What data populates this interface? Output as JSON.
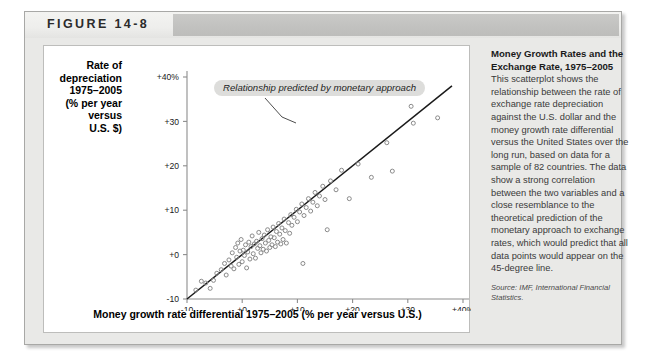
{
  "figure": {
    "title": "FIGURE 14-8"
  },
  "caption": {
    "heading": "Money Growth Rates and the Exchange Rate, 1975–2005",
    "body": " This scatterplot shows the relationship between the rate of exchange rate depreciation against the U.S. dollar and the money growth rate differential versus the United States over the long run, based on data for a sample of 82 countries. The data show a strong correlation between the two variables and a close resemblance to the theoretical prediction of the monetary approach to exchange rates, which would predict that all data points would appear on the 45-degree line.",
    "source": "Source: IMF, International Financial Statistics."
  },
  "annotation": {
    "text": "Relationship predicted by monetary approach"
  },
  "chart_data": {
    "type": "scatter",
    "title": "",
    "xlabel": "Money growth rate differential 1975–2005 (% per year versus U.S.)",
    "ylabel": "Rate of depreciation\n1975–2005\n(% per year\nversus\nU.S. $)",
    "xlim": [
      -10,
      40
    ],
    "ylim": [
      -10,
      40
    ],
    "xticks": [
      -10,
      0,
      10,
      20,
      30,
      40
    ],
    "yticks": [
      -10,
      0,
      10,
      20,
      30,
      40
    ],
    "xticklabels": [
      "-10",
      "+0",
      "+10",
      "+20",
      "+30",
      "+40%"
    ],
    "yticklabels": [
      "-10",
      "+0",
      "+10",
      "+20",
      "+30",
      "+40%"
    ],
    "grid": false,
    "legend": null,
    "reference_line": {
      "label": "45-degree line",
      "from": [
        -10,
        -10
      ],
      "to": [
        38,
        38
      ]
    },
    "marker": {
      "shape": "open-circle",
      "size": 4,
      "color": "#8a8a8a"
    },
    "points": [
      [
        -8.4,
        -8.0
      ],
      [
        -6.6,
        -6.4
      ],
      [
        -5.2,
        -5.8
      ],
      [
        -4.6,
        -4.2
      ],
      [
        -3.8,
        -3.4
      ],
      [
        -3.2,
        -2.0
      ],
      [
        -2.9,
        -4.6
      ],
      [
        -2.4,
        -1.2
      ],
      [
        -2.0,
        -2.6
      ],
      [
        -1.8,
        0.4
      ],
      [
        -1.5,
        -3.2
      ],
      [
        -1.2,
        1.6
      ],
      [
        -1.0,
        -0.6
      ],
      [
        -0.8,
        2.6
      ],
      [
        -0.6,
        -2.2
      ],
      [
        -0.4,
        0.8
      ],
      [
        -0.2,
        3.4
      ],
      [
        0.0,
        -1.6
      ],
      [
        0.2,
        1.0
      ],
      [
        0.4,
        -0.2
      ],
      [
        0.6,
        2.2
      ],
      [
        0.8,
        -3.0
      ],
      [
        1.0,
        0.6
      ],
      [
        1.2,
        2.8
      ],
      [
        1.4,
        -1.0
      ],
      [
        1.6,
        1.8
      ],
      [
        1.8,
        4.2
      ],
      [
        2.0,
        0.2
      ],
      [
        2.2,
        2.4
      ],
      [
        2.4,
        -0.8
      ],
      [
        2.6,
        3.0
      ],
      [
        2.8,
        1.4
      ],
      [
        3.0,
        5.0
      ],
      [
        3.2,
        2.0
      ],
      [
        3.4,
        0.4
      ],
      [
        3.6,
        3.6
      ],
      [
        3.8,
        1.2
      ],
      [
        4.0,
        4.4
      ],
      [
        4.2,
        2.6
      ],
      [
        4.4,
        0.8
      ],
      [
        4.6,
        5.6
      ],
      [
        4.8,
        3.2
      ],
      [
        5.0,
        1.6
      ],
      [
        5.2,
        4.0
      ],
      [
        5.4,
        2.2
      ],
      [
        5.6,
        6.2
      ],
      [
        5.8,
        3.8
      ],
      [
        6.0,
        1.8
      ],
      [
        6.2,
        5.2
      ],
      [
        6.4,
        2.8
      ],
      [
        6.6,
        7.0
      ],
      [
        6.8,
        4.6
      ],
      [
        7.0,
        2.4
      ],
      [
        7.2,
        6.0
      ],
      [
        7.4,
        3.4
      ],
      [
        7.6,
        8.0
      ],
      [
        7.8,
        5.4
      ],
      [
        8.0,
        2.6
      ],
      [
        8.4,
        7.2
      ],
      [
        8.6,
        4.8
      ],
      [
        8.8,
        9.0
      ],
      [
        9.0,
        6.6
      ],
      [
        9.4,
        8.4
      ],
      [
        9.8,
        10.2
      ],
      [
        10.0,
        7.4
      ],
      [
        10.4,
        9.6
      ],
      [
        10.8,
        11.4
      ],
      [
        11.2,
        8.8
      ],
      [
        11.6,
        10.6
      ],
      [
        12.0,
        12.6
      ],
      [
        12.4,
        9.8
      ],
      [
        12.8,
        11.8
      ],
      [
        13.2,
        14.0
      ],
      [
        13.6,
        11.0
      ],
      [
        14.0,
        13.2
      ],
      [
        14.6,
        15.4
      ],
      [
        15.0,
        12.4
      ],
      [
        15.4,
        5.6
      ],
      [
        16.0,
        16.6
      ],
      [
        17.0,
        14.6
      ],
      [
        18.0,
        19.0
      ],
      [
        19.4,
        12.6
      ],
      [
        21.0,
        20.4
      ],
      [
        23.4,
        17.4
      ],
      [
        26.2,
        25.2
      ],
      [
        27.2,
        18.8
      ],
      [
        30.6,
        33.4
      ],
      [
        31.0,
        29.6
      ],
      [
        35.4,
        30.8
      ],
      [
        11.0,
        -2.0
      ],
      [
        -5.8,
        -7.6
      ],
      [
        -7.4,
        -6.0
      ]
    ]
  }
}
